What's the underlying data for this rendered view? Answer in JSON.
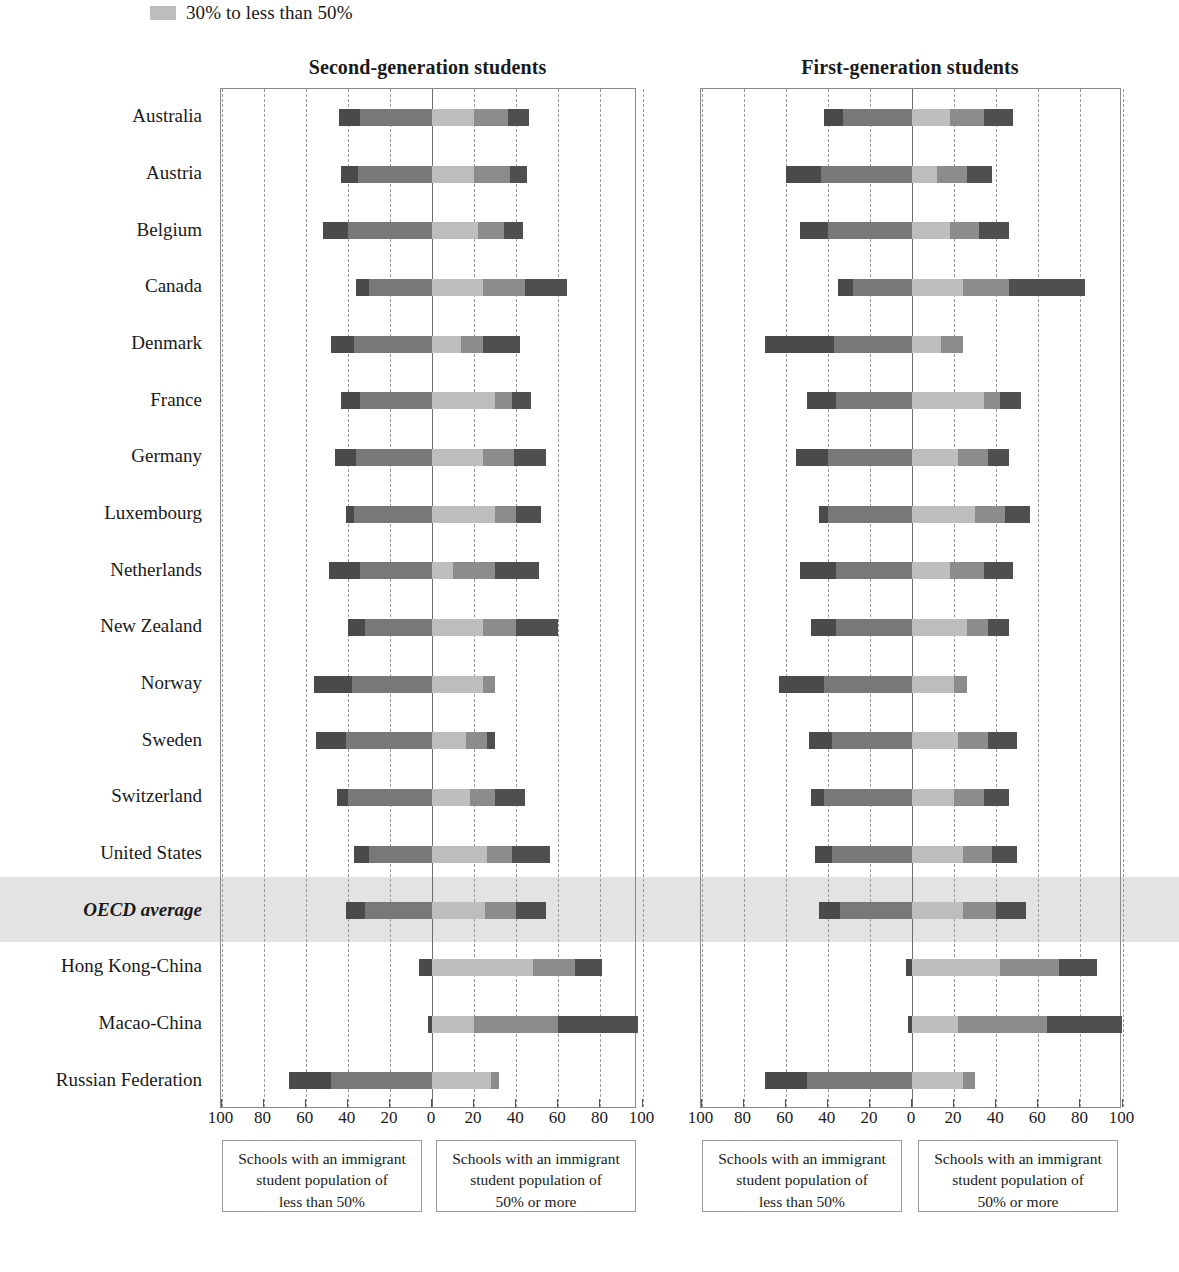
{
  "legend": {
    "swatch_name": "legend-swatch-30-to-50",
    "label": "30% to less than 50%",
    "swatch_color": "#bdbdbd"
  },
  "panels": {
    "left_title": "Second-generation students",
    "right_title": "First-generation students"
  },
  "axis": {
    "tick_labels": [
      "100",
      "80",
      "60",
      "40",
      "20",
      "0",
      "20",
      "40",
      "60",
      "80",
      "100"
    ],
    "tick_values": [
      -100,
      -80,
      -60,
      -40,
      -20,
      0,
      20,
      40,
      60,
      80,
      100
    ],
    "min": -100,
    "max": 100
  },
  "notes": {
    "left_less": "Schools with an immigrant student population of less than 50%",
    "left_more": "Schools with an immigrant student population of 50% or more",
    "right_less": "Schools with an immigrant student population of less than 50%",
    "right_more": "Schools with an immigrant student population of 50% or more",
    "line1": "Schools with an immigrant",
    "line2": "student population of",
    "line3_less": "less than 50%",
    "line3_more": "50% or more"
  },
  "colors": {
    "seg1": "#4a4a4a",
    "seg2": "#787878",
    "seg3": "#bdbdbd",
    "seg4": "#8c8c8c",
    "seg5": "#4f4f4f",
    "highlight": "#d9d9d9",
    "grid": "#9a9a9a",
    "zero_line": "#6e6e6e",
    "frame": "#8a8a8a"
  },
  "chart_data": {
    "type": "bar",
    "orientation": "horizontal",
    "stacked": true,
    "diverging": true,
    "title": "",
    "xlabel": "",
    "ylabel": "",
    "xlim": [
      -100,
      100
    ],
    "grid": true,
    "legend_position": "top",
    "categories": [
      "Australia",
      "Austria",
      "Belgium",
      "Canada",
      "Denmark",
      "France",
      "Germany",
      "Luxembourg",
      "Netherlands",
      "New Zealand",
      "Norway",
      "Sweden",
      "Switzerland",
      "United States",
      "OECD average",
      "Hong Kong-China",
      "Macao-China",
      "Russian Federation"
    ],
    "highlight_category": "OECD average",
    "series_names": [
      "less than 10%",
      "10% to less than 30%",
      "30% to less than 50%",
      "50% to less than 70%",
      "70% or more"
    ],
    "panels": [
      {
        "name": "Second-generation students",
        "rows": [
          {
            "category": "Australia",
            "negative": [
              -10,
              -34
            ],
            "positive": [
              20,
              16,
              10
            ]
          },
          {
            "category": "Austria",
            "negative": [
              -8,
              -35
            ],
            "positive": [
              20,
              17,
              8
            ]
          },
          {
            "category": "Belgium",
            "negative": [
              -12,
              -40
            ],
            "positive": [
              22,
              12,
              9
            ]
          },
          {
            "category": "Canada",
            "negative": [
              -6,
              -30
            ],
            "positive": [
              24,
              20,
              20
            ]
          },
          {
            "category": "Denmark",
            "negative": [
              -11,
              -37
            ],
            "positive": [
              14,
              10,
              18
            ]
          },
          {
            "category": "France",
            "negative": [
              -9,
              -34
            ],
            "positive": [
              30,
              8,
              9
            ]
          },
          {
            "category": "Germany",
            "negative": [
              -10,
              -36
            ],
            "positive": [
              24,
              15,
              15
            ]
          },
          {
            "category": "Luxembourg",
            "negative": [
              -4,
              -37
            ],
            "positive": [
              30,
              10,
              12
            ]
          },
          {
            "category": "Netherlands",
            "negative": [
              -15,
              -34
            ],
            "positive": [
              10,
              20,
              21
            ]
          },
          {
            "category": "New Zealand",
            "negative": [
              -8,
              -32
            ],
            "positive": [
              24,
              16,
              20
            ]
          },
          {
            "category": "Norway",
            "negative": [
              -18,
              -38
            ],
            "positive": [
              24,
              6,
              0
            ]
          },
          {
            "category": "Sweden",
            "negative": [
              -14,
              -41
            ],
            "positive": [
              16,
              10,
              4
            ]
          },
          {
            "category": "Switzerland",
            "negative": [
              -5,
              -40
            ],
            "positive": [
              18,
              12,
              14
            ]
          },
          {
            "category": "United States",
            "negative": [
              -7,
              -30
            ],
            "positive": [
              26,
              12,
              18
            ]
          },
          {
            "category": "OECD average",
            "negative": [
              -9,
              -32
            ],
            "positive": [
              25,
              15,
              14
            ]
          },
          {
            "category": "Hong Kong-China",
            "negative": [
              -6,
              0
            ],
            "positive": [
              48,
              20,
              13
            ]
          },
          {
            "category": "Macao-China",
            "negative": [
              -2,
              0
            ],
            "positive": [
              20,
              40,
              38
            ]
          },
          {
            "category": "Russian Federation",
            "negative": [
              -20,
              -48
            ],
            "positive": [
              28,
              4,
              0
            ]
          }
        ]
      },
      {
        "name": "First-generation students",
        "rows": [
          {
            "category": "Australia",
            "negative": [
              -9,
              -33
            ],
            "positive": [
              18,
              16,
              14
            ]
          },
          {
            "category": "Austria",
            "negative": [
              -17,
              -43
            ],
            "positive": [
              12,
              14,
              12
            ]
          },
          {
            "category": "Belgium",
            "negative": [
              -13,
              -40
            ],
            "positive": [
              18,
              14,
              14
            ]
          },
          {
            "category": "Canada",
            "negative": [
              -7,
              -28
            ],
            "positive": [
              24,
              22,
              36
            ]
          },
          {
            "category": "Denmark",
            "negative": [
              -33,
              -37
            ],
            "positive": [
              14,
              10,
              0
            ]
          },
          {
            "category": "France",
            "negative": [
              -14,
              -36
            ],
            "positive": [
              34,
              8,
              10
            ]
          },
          {
            "category": "Germany",
            "negative": [
              -15,
              -40
            ],
            "positive": [
              22,
              14,
              10
            ]
          },
          {
            "category": "Luxembourg",
            "negative": [
              -4,
              -40
            ],
            "positive": [
              30,
              14,
              12
            ]
          },
          {
            "category": "Netherlands",
            "negative": [
              -17,
              -36
            ],
            "positive": [
              18,
              16,
              14
            ]
          },
          {
            "category": "New Zealand",
            "negative": [
              -12,
              -36
            ],
            "positive": [
              26,
              10,
              10
            ]
          },
          {
            "category": "Norway",
            "negative": [
              -21,
              -42
            ],
            "positive": [
              20,
              6,
              0
            ]
          },
          {
            "category": "Sweden",
            "negative": [
              -11,
              -38
            ],
            "positive": [
              22,
              14,
              14
            ]
          },
          {
            "category": "Switzerland",
            "negative": [
              -6,
              -42
            ],
            "positive": [
              20,
              14,
              12
            ]
          },
          {
            "category": "United States",
            "negative": [
              -8,
              -38
            ],
            "positive": [
              24,
              14,
              12
            ]
          },
          {
            "category": "OECD average",
            "negative": [
              -10,
              -34
            ],
            "positive": [
              24,
              16,
              14
            ]
          },
          {
            "category": "Hong Kong-China",
            "negative": [
              -3,
              0
            ],
            "positive": [
              42,
              28,
              18
            ]
          },
          {
            "category": "Macao-China",
            "negative": [
              -2,
              0
            ],
            "positive": [
              22,
              42,
              36
            ]
          },
          {
            "category": "Russian Federation",
            "negative": [
              -20,
              -50
            ],
            "positive": [
              24,
              6,
              0
            ]
          }
        ]
      }
    ]
  }
}
